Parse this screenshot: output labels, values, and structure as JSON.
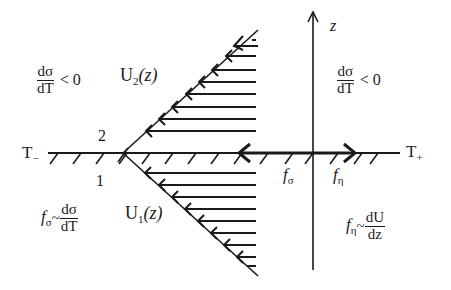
{
  "diagram": {
    "axes": {
      "horizontal": {
        "left_label": "T",
        "left_subscript": "−",
        "right_label": "T",
        "right_subscript": "+"
      },
      "vertical": {
        "label": "z"
      }
    },
    "points": {
      "upper": "2",
      "lower": "1"
    },
    "regions": {
      "upper_left": {
        "numerator": "dσ",
        "denominator": "dT",
        "relation": "< 0"
      },
      "upper_right": {
        "numerator": "dσ",
        "denominator": "dT",
        "relation": "< 0"
      },
      "lower_left": {
        "symbol": "f",
        "subscript": "σ",
        "tilde": "~",
        "numerator": "dσ",
        "denominator": "dT"
      },
      "lower_right": {
        "symbol": "f",
        "subscript": "η",
        "tilde": "~",
        "numerator": "dU",
        "denominator": "dz"
      }
    },
    "profiles": {
      "upper": {
        "name": "U",
        "subscript": "2",
        "arg": "(z)"
      },
      "lower": {
        "name": "U",
        "subscript": "1",
        "arg": "(z)"
      }
    },
    "forces": {
      "f_sigma": {
        "symbol": "f",
        "subscript": "σ"
      },
      "f_eta": {
        "symbol": "f",
        "subscript": "η"
      }
    },
    "colors": {
      "ink": "#1a1a1a",
      "background": "#ffffff"
    }
  }
}
